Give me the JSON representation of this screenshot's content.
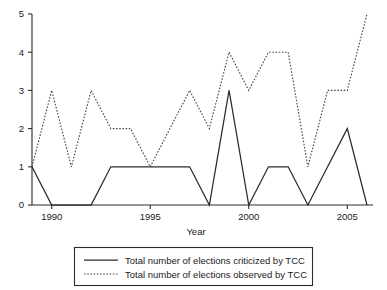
{
  "chart_data": {
    "type": "line",
    "title": "",
    "xlabel": "Year",
    "ylabel": "",
    "x": [
      1989,
      1990,
      1991,
      1992,
      1993,
      1994,
      1995,
      1996,
      1997,
      1998,
      1999,
      2000,
      2001,
      2002,
      2003,
      2004,
      2005,
      2006
    ],
    "xlim": [
      1989,
      2006
    ],
    "ylim": [
      0,
      5
    ],
    "xticks": [
      1990,
      1995,
      2000,
      2005
    ],
    "xticklabels": [
      "1990",
      "1995",
      "2000",
      "2005"
    ],
    "yticks": [
      0,
      1,
      2,
      3,
      4,
      5
    ],
    "yticklabels": [
      "0",
      "1",
      "2",
      "3",
      "4",
      "5"
    ],
    "grid": false,
    "legend_position": "below-center",
    "series": [
      {
        "name": "Total number of elections criticized by TCC",
        "style": "solid",
        "color": "#2b2b2b",
        "values": [
          1,
          0,
          0,
          0,
          1,
          1,
          1,
          1,
          1,
          0,
          3,
          0,
          1,
          1,
          0,
          1,
          2,
          0
        ]
      },
      {
        "name": "Total number of elections observed by TCC",
        "style": "dotted",
        "color": "#4a4a4a",
        "values": [
          1,
          3,
          1,
          3,
          2,
          2,
          1,
          2,
          3,
          2,
          4,
          3,
          4,
          4,
          1,
          3,
          3,
          5
        ]
      }
    ]
  },
  "axes": {
    "x_axis_title": "Year"
  },
  "legend": {
    "entries": [
      {
        "label": "Total number of elections criticized by TCC",
        "style": "solid"
      },
      {
        "label": "Total number of elections observed by TCC",
        "style": "dotted"
      }
    ]
  }
}
